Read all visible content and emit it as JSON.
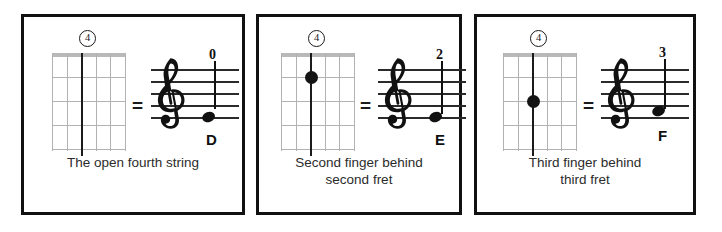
{
  "figure": {
    "background_color": "#ffffff",
    "panel_border_color": "#111111",
    "string_color_active": "#1b1b1b",
    "string_color_inactive": "#b2b2b2"
  },
  "panels": [
    {
      "string_number": "4",
      "fretboard": {
        "strings": 6,
        "frets": 4,
        "active_string_index": 3,
        "dot": null,
        "dot_fret": 0
      },
      "equals_symbol": "=",
      "notation": {
        "clef": "treble-clef",
        "fret_number": "0",
        "note_letter": "D",
        "staff_lines": 5
      },
      "caption_lines": [
        "The open fourth string"
      ]
    },
    {
      "string_number": "4",
      "fretboard": {
        "strings": 6,
        "frets": 4,
        "active_string_index": 3,
        "dot": "finger-dot",
        "dot_fret": 2
      },
      "equals_symbol": "=",
      "notation": {
        "clef": "treble-clef",
        "fret_number": "2",
        "note_letter": "E",
        "staff_lines": 5
      },
      "caption_lines": [
        "Second finger behind",
        "second fret"
      ]
    },
    {
      "string_number": "4",
      "fretboard": {
        "strings": 6,
        "frets": 4,
        "active_string_index": 3,
        "dot": "finger-dot",
        "dot_fret": 3
      },
      "equals_symbol": "=",
      "notation": {
        "clef": "treble-clef",
        "fret_number": "3",
        "note_letter": "F",
        "staff_lines": 5
      },
      "caption_lines": [
        "Third finger behind",
        "third fret"
      ]
    }
  ]
}
